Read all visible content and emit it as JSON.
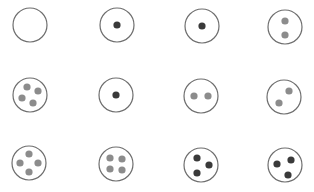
{
  "diagram": {
    "colors": {
      "outline": "#6e6e6e",
      "dark_dot": "#3a3a3a",
      "gray_dot": "#8c8c8c",
      "background": "#ffffff"
    },
    "circle_radius": 17,
    "dot_radius": 3.6,
    "circles": [
      {
        "id": 1,
        "row": 1,
        "col": 1,
        "cx": 30,
        "cy": 25,
        "dots": []
      },
      {
        "id": 2,
        "row": 1,
        "col": 2,
        "cx": 117,
        "cy": 25,
        "dots": [
          {
            "dx": 0,
            "dy": 0,
            "tone": "dark"
          }
        ]
      },
      {
        "id": 3,
        "row": 1,
        "col": 3,
        "cx": 202,
        "cy": 26,
        "dots": [
          {
            "dx": 0,
            "dy": 0,
            "tone": "dark"
          }
        ]
      },
      {
        "id": 4,
        "row": 1,
        "col": 4,
        "cx": 285,
        "cy": 27,
        "dots": [
          {
            "dx": 0,
            "dy": -6,
            "tone": "gray"
          },
          {
            "dx": 0,
            "dy": 8,
            "tone": "gray"
          }
        ]
      },
      {
        "id": 5,
        "row": 2,
        "col": 1,
        "cx": 30,
        "cy": 95,
        "dots": [
          {
            "dx": -3,
            "dy": -8,
            "tone": "gray"
          },
          {
            "dx": 8,
            "dy": -4,
            "tone": "gray"
          },
          {
            "dx": -8,
            "dy": 3,
            "tone": "gray"
          },
          {
            "dx": 3,
            "dy": 8,
            "tone": "gray"
          }
        ]
      },
      {
        "id": 6,
        "row": 2,
        "col": 2,
        "cx": 116,
        "cy": 95,
        "dots": [
          {
            "dx": 0,
            "dy": 0,
            "tone": "dark"
          }
        ]
      },
      {
        "id": 7,
        "row": 2,
        "col": 3,
        "cx": 201,
        "cy": 96,
        "dots": [
          {
            "dx": -7,
            "dy": 0,
            "tone": "gray"
          },
          {
            "dx": 7,
            "dy": 0,
            "tone": "gray"
          }
        ]
      },
      {
        "id": 8,
        "row": 2,
        "col": 4,
        "cx": 284,
        "cy": 97,
        "dots": [
          {
            "dx": 5,
            "dy": -6,
            "tone": "gray"
          },
          {
            "dx": -5,
            "dy": 6,
            "tone": "gray"
          }
        ]
      },
      {
        "id": 9,
        "row": 3,
        "col": 1,
        "cx": 29,
        "cy": 163,
        "dots": [
          {
            "dx": 0,
            "dy": -9,
            "tone": "gray"
          },
          {
            "dx": -9,
            "dy": 0,
            "tone": "gray"
          },
          {
            "dx": 9,
            "dy": 0,
            "tone": "gray"
          },
          {
            "dx": 0,
            "dy": 9,
            "tone": "gray"
          }
        ]
      },
      {
        "id": 10,
        "row": 3,
        "col": 2,
        "cx": 116,
        "cy": 164,
        "dots": [
          {
            "dx": -6,
            "dy": -6,
            "tone": "gray"
          },
          {
            "dx": 6,
            "dy": -5,
            "tone": "gray"
          },
          {
            "dx": -6,
            "dy": 5,
            "tone": "gray"
          },
          {
            "dx": 6,
            "dy": 6,
            "tone": "gray"
          }
        ]
      },
      {
        "id": 11,
        "row": 3,
        "col": 3,
        "cx": 201,
        "cy": 165,
        "dots": [
          {
            "dx": -4,
            "dy": -7,
            "tone": "dark"
          },
          {
            "dx": 8,
            "dy": 0,
            "tone": "dark"
          },
          {
            "dx": -4,
            "dy": 8,
            "tone": "dark"
          }
        ]
      },
      {
        "id": 12,
        "row": 3,
        "col": 4,
        "cx": 285,
        "cy": 165,
        "dots": [
          {
            "dx": -8,
            "dy": -1,
            "tone": "dark"
          },
          {
            "dx": 6,
            "dy": -5,
            "tone": "dark"
          },
          {
            "dx": 3,
            "dy": 10,
            "tone": "dark"
          }
        ]
      }
    ]
  }
}
